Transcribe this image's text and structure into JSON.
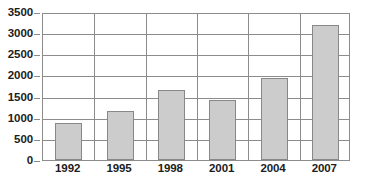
{
  "chart_data": {
    "type": "bar",
    "title": "",
    "subtitle": "",
    "xlabel": "",
    "ylabel": "",
    "categories": [
      "1992",
      "1995",
      "1998",
      "2001",
      "2004",
      "2007"
    ],
    "values": [
      880,
      1150,
      1650,
      1430,
      1950,
      3200
    ],
    "series": [
      {
        "name": "",
        "values": [
          880,
          1150,
          1650,
          1430,
          1950,
          3200
        ]
      }
    ],
    "ylim": [
      0,
      3500
    ],
    "ytick_labels": [
      "0",
      "500",
      "1000",
      "1500",
      "2000",
      "2500",
      "3000",
      "3500"
    ],
    "ytick_values": [
      0,
      500,
      1000,
      1500,
      2000,
      2500,
      3000,
      3500
    ],
    "grid": "horizontal",
    "legend": "none",
    "bar_color": "#cccccc",
    "bar_border_color": "#888888",
    "axis_color": "#8c8c8c",
    "text_color": "#1c1c1c",
    "background_color": "#ffffff"
  }
}
